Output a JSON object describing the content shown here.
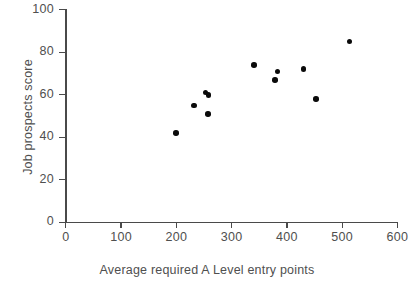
{
  "chart_data": {
    "type": "scatter",
    "title": "",
    "xlabel": "Average required A Level entry points",
    "ylabel": "Job prospects score",
    "xlim": [
      0,
      600
    ],
    "ylim": [
      0,
      100
    ],
    "xticks": [
      0,
      100,
      200,
      300,
      400,
      500,
      600
    ],
    "yticks": [
      0,
      20,
      40,
      60,
      80,
      100
    ],
    "xtick_labels": [
      "0",
      "100",
      "200",
      "300",
      "400",
      "500",
      "600"
    ],
    "ytick_labels": [
      "0",
      "20",
      "40",
      "60",
      "80",
      "100"
    ],
    "grid": false,
    "legend": null,
    "marker_color": "#0a0a0a",
    "axis_color": "#4a4a4a",
    "points": [
      {
        "x": 199,
        "y": 42
      },
      {
        "x": 232,
        "y": 55
      },
      {
        "x": 253,
        "y": 61
      },
      {
        "x": 258,
        "y": 60
      },
      {
        "x": 257,
        "y": 51
      },
      {
        "x": 340,
        "y": 74
      },
      {
        "x": 378,
        "y": 67
      },
      {
        "x": 383,
        "y": 71
      },
      {
        "x": 430,
        "y": 72
      },
      {
        "x": 453,
        "y": 58
      },
      {
        "x": 513,
        "y": 85
      }
    ]
  }
}
